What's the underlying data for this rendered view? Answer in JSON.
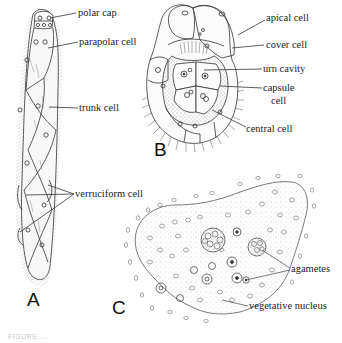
{
  "figure": {
    "panels": [
      {
        "id": "A",
        "letter": "A",
        "subject": "rhombogen / dicyemid body (elongate)",
        "labels": [
          {
            "text": "polar cap"
          },
          {
            "text": "parapolar cell"
          },
          {
            "text": "trunk cell"
          },
          {
            "text": "verruciform cell"
          }
        ]
      },
      {
        "id": "B",
        "letter": "B",
        "subject": "infusoriform larva (section)",
        "labels": [
          {
            "text": "apical cell"
          },
          {
            "text": "cover cell"
          },
          {
            "text": "urn cavity"
          },
          {
            "text": "capsule"
          },
          {
            "text": "cell"
          },
          {
            "text": "central cell"
          }
        ]
      },
      {
        "id": "C",
        "letter": "C",
        "subject": "plasmodium with agametes",
        "labels": [
          {
            "text": "agametes"
          },
          {
            "text": "vegetative nucleus"
          }
        ]
      }
    ],
    "caption": "FIGURE ..."
  }
}
